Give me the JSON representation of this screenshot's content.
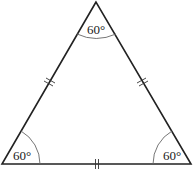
{
  "diagram": {
    "type": "equilateral-triangle",
    "vertices": {
      "apex": {
        "x": 96,
        "y": 2
      },
      "bottom_left": {
        "x": 2,
        "y": 164
      },
      "bottom_right": {
        "x": 191,
        "y": 164
      }
    },
    "angles": {
      "top": "60°",
      "bottom_left": "60°",
      "bottom_right": "60°"
    },
    "side_marks": {
      "left": "||",
      "right": "||",
      "bottom": "||"
    },
    "colors": {
      "stroke": "#222222",
      "arc": "#555555",
      "background": "#ffffff"
    }
  }
}
